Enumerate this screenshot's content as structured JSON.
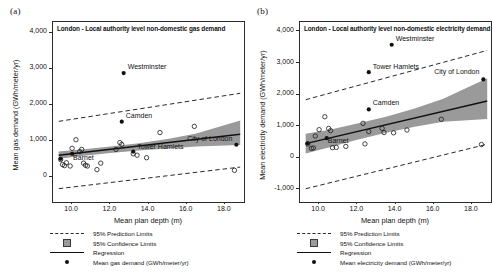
{
  "figure": {
    "panels": [
      {
        "tag": "(a)",
        "title": "London - Local authority level non-domestic gas demand",
        "ylabel": "Mean gas demand (GWh/meter/yr)",
        "xlabel": "Mean plan depth (m)",
        "legend": [
          {
            "key": "dashed-line",
            "label": "95% Prediction Limits"
          },
          {
            "key": "shaded-square",
            "label": "95% Confidence Limits"
          },
          {
            "key": "solid-line",
            "label": "Regression"
          },
          {
            "key": "filled-dot",
            "label": "Mean gas demand (GWh/meter/yr)"
          }
        ]
      },
      {
        "tag": "(b)",
        "title": "London - Local authority level non-domestic electricity demand",
        "ylabel": "Mean electricity demand (GWh/meter/yr)",
        "xlabel": "Mean plan depth (m)",
        "legend": [
          {
            "key": "dashed-line",
            "label": "95% Prediction Limits"
          },
          {
            "key": "shaded-square",
            "label": "95% Confidence Limits"
          },
          {
            "key": "solid-line",
            "label": "Regression"
          },
          {
            "key": "filled-dot",
            "label": "Mean electricity demand (GWh/meter/yr)"
          }
        ]
      }
    ]
  },
  "chart_data": [
    {
      "type": "scatter",
      "panel": "a",
      "title": "London - Local authority level non-domestic gas demand",
      "xlabel": "Mean plan depth (m)",
      "ylabel": "Mean gas demand (GWh/meter/yr)",
      "xlim": [
        9.0,
        19.0
      ],
      "ylim": [
        -700,
        4300
      ],
      "xticks": [
        10.0,
        12.0,
        14.0,
        16.0,
        18.0
      ],
      "xticklabels": [
        "10.0",
        "12.0",
        "14.0",
        "16.0",
        "18.0"
      ],
      "yticks": [
        0,
        1000,
        2000,
        3000,
        4000
      ],
      "yticklabels": [
        "0",
        "1,000",
        "2,000",
        "3,000",
        "4,000"
      ],
      "grid": false,
      "legend_position": "below-axes",
      "regression": {
        "x": [
          9.3,
          18.8
        ],
        "y": [
          600,
          1180
        ]
      },
      "confidence_band": {
        "x": [
          9.3,
          10.5,
          12.0,
          13.5,
          15.0,
          16.5,
          18.8
        ],
        "upper": [
          700,
          760,
          840,
          930,
          1050,
          1200,
          1560
        ],
        "lower": [
          500,
          580,
          660,
          730,
          790,
          840,
          880
        ]
      },
      "prediction_upper": {
        "x": [
          9.3,
          18.8
        ],
        "y": [
          1540,
          2320
        ]
      },
      "prediction_lower": {
        "x": [
          9.3,
          18.8
        ],
        "y": [
          -330,
          270
        ]
      },
      "points": [
        {
          "x": 12.7,
          "y": 2880,
          "label": "Westminster",
          "filled": true
        },
        {
          "x": 12.6,
          "y": 1530,
          "label": "Camden",
          "filled": true
        },
        {
          "x": 13.2,
          "y": 700,
          "label": "Tower Hamlets",
          "filled": true
        },
        {
          "x": 18.6,
          "y": 890,
          "label": "City of London",
          "filled": true
        },
        {
          "x": 10.0,
          "y": 640,
          "label": "Barnet",
          "filled": true
        },
        {
          "x": 9.4,
          "y": 500,
          "label": "",
          "filled": true
        },
        {
          "x": 9.4,
          "y": 480,
          "label": "",
          "filled": false
        },
        {
          "x": 9.5,
          "y": 340,
          "label": "",
          "filled": false
        },
        {
          "x": 9.6,
          "y": 310,
          "label": "",
          "filled": false
        },
        {
          "x": 9.7,
          "y": 390,
          "label": "",
          "filled": false
        },
        {
          "x": 9.9,
          "y": 300,
          "label": "",
          "filled": false
        },
        {
          "x": 10.0,
          "y": 790,
          "label": "",
          "filled": false
        },
        {
          "x": 10.2,
          "y": 1030,
          "label": "",
          "filled": false
        },
        {
          "x": 10.4,
          "y": 700,
          "label": "",
          "filled": false
        },
        {
          "x": 10.5,
          "y": 760,
          "label": "",
          "filled": false
        },
        {
          "x": 10.6,
          "y": 380,
          "label": "",
          "filled": false
        },
        {
          "x": 10.7,
          "y": 320,
          "label": "",
          "filled": false
        },
        {
          "x": 10.8,
          "y": 300,
          "label": "",
          "filled": false
        },
        {
          "x": 11.3,
          "y": 200,
          "label": "",
          "filled": false
        },
        {
          "x": 11.5,
          "y": 380,
          "label": "",
          "filled": false
        },
        {
          "x": 12.3,
          "y": 760,
          "label": "",
          "filled": false
        },
        {
          "x": 12.5,
          "y": 950,
          "label": "",
          "filled": false
        },
        {
          "x": 12.6,
          "y": 900,
          "label": "",
          "filled": false
        },
        {
          "x": 13.2,
          "y": 640,
          "label": "",
          "filled": false
        },
        {
          "x": 13.4,
          "y": 600,
          "label": "",
          "filled": false
        },
        {
          "x": 13.9,
          "y": 530,
          "label": "",
          "filled": false
        },
        {
          "x": 14.6,
          "y": 1230,
          "label": "",
          "filled": false
        },
        {
          "x": 16.4,
          "y": 1400,
          "label": "",
          "filled": false
        },
        {
          "x": 18.5,
          "y": 180,
          "label": "",
          "filled": false
        }
      ]
    },
    {
      "type": "scatter",
      "panel": "b",
      "title": "London - Local authority level non-domestic electricity demand",
      "xlabel": "Mean plan depth (m)",
      "ylabel": "Mean electricity demand (GWh/meter/yr)",
      "xlim": [
        9.0,
        19.0
      ],
      "ylim": [
        -1400,
        4300
      ],
      "xticks": [
        10.0,
        12.0,
        14.0,
        16.0,
        18.0
      ],
      "xticklabels": [
        "10.0",
        "12.0",
        "14.0",
        "16.0",
        "18.0"
      ],
      "yticks": [
        -1000,
        0,
        1000,
        2000,
        3000,
        4000
      ],
      "yticklabels": [
        "-1,000",
        "0",
        "1,000",
        "2,000",
        "3,000",
        "4,000"
      ],
      "grid": false,
      "legend_position": "below-axes",
      "regression": {
        "x": [
          9.3,
          18.8
        ],
        "y": [
          450,
          1800
        ]
      },
      "confidence_band": {
        "x": [
          9.3,
          10.5,
          12.0,
          13.5,
          15.0,
          16.5,
          18.8
        ],
        "upper": [
          760,
          880,
          1090,
          1300,
          1560,
          1870,
          2520
        ],
        "lower": [
          140,
          330,
          570,
          790,
          980,
          1140,
          1230
        ]
      },
      "prediction_upper": {
        "x": [
          9.3,
          18.8
        ],
        "y": [
          1840,
          3400
        ]
      },
      "prediction_lower": {
        "x": [
          9.3,
          18.8
        ],
        "y": [
          -980,
          430
        ]
      },
      "points": [
        {
          "x": 13.8,
          "y": 3580,
          "label": "Westminster",
          "filled": true
        },
        {
          "x": 12.6,
          "y": 2710,
          "label": "Tower Hamlets",
          "filled": true
        },
        {
          "x": 18.6,
          "y": 2480,
          "label": "City of London",
          "filled": true
        },
        {
          "x": 12.6,
          "y": 1530,
          "label": "Camden",
          "filled": true
        },
        {
          "x": 10.4,
          "y": 620,
          "label": "Barnet",
          "filled": true
        },
        {
          "x": 9.4,
          "y": 460,
          "label": "",
          "filled": true
        },
        {
          "x": 9.4,
          "y": 440,
          "label": "",
          "filled": false
        },
        {
          "x": 9.6,
          "y": 300,
          "label": "",
          "filled": false
        },
        {
          "x": 9.7,
          "y": 310,
          "label": "",
          "filled": false
        },
        {
          "x": 9.8,
          "y": 690,
          "label": "",
          "filled": false
        },
        {
          "x": 10.0,
          "y": 890,
          "label": "",
          "filled": false
        },
        {
          "x": 10.3,
          "y": 1300,
          "label": "",
          "filled": false
        },
        {
          "x": 10.5,
          "y": 930,
          "label": "",
          "filled": false
        },
        {
          "x": 10.6,
          "y": 860,
          "label": "",
          "filled": false
        },
        {
          "x": 10.7,
          "y": 320,
          "label": "",
          "filled": false
        },
        {
          "x": 10.9,
          "y": 330,
          "label": "",
          "filled": false
        },
        {
          "x": 11.4,
          "y": 360,
          "label": "",
          "filled": false
        },
        {
          "x": 12.3,
          "y": 1090,
          "label": "",
          "filled": false
        },
        {
          "x": 12.4,
          "y": 440,
          "label": "",
          "filled": false
        },
        {
          "x": 12.6,
          "y": 830,
          "label": "",
          "filled": false
        },
        {
          "x": 13.3,
          "y": 930,
          "label": "",
          "filled": false
        },
        {
          "x": 13.4,
          "y": 800,
          "label": "",
          "filled": false
        },
        {
          "x": 13.9,
          "y": 790,
          "label": "",
          "filled": false
        },
        {
          "x": 14.6,
          "y": 880,
          "label": "",
          "filled": false
        },
        {
          "x": 16.4,
          "y": 1220,
          "label": "",
          "filled": false
        },
        {
          "x": 18.5,
          "y": 420,
          "label": "",
          "filled": false
        }
      ]
    }
  ],
  "colors": {
    "band": "#9a9a9a",
    "line": "#111111",
    "frame": "#2b2b2b",
    "marker": "#111111"
  }
}
